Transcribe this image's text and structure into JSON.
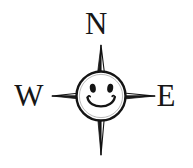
{
  "illustration": {
    "title": "Compass rose with smiley face",
    "width": 193,
    "height": 168,
    "background_color": "#ffffff",
    "ink_color": "#161616",
    "style": "hand-drawn black ink line art on white paper"
  },
  "labels": {
    "north": "N",
    "west": "W",
    "east": "E"
  },
  "compass": {
    "center_x": 101,
    "center_y": 96,
    "points": [
      {
        "name": "north-point",
        "direction": "N",
        "tip_x": 101,
        "tip_y": 45
      },
      {
        "name": "south-point",
        "direction": "S",
        "tip_x": 101,
        "tip_y": 155
      },
      {
        "name": "west-point",
        "direction": "W",
        "tip_x": 52,
        "tip_y": 96
      },
      {
        "name": "east-point",
        "direction": "E",
        "tip_x": 155,
        "tip_y": 96
      }
    ]
  },
  "face": {
    "name": "smiley-face",
    "center_x": 101,
    "center_y": 96,
    "radius": 25,
    "expression": "smiling",
    "eyes": [
      {
        "name": "left-eye",
        "cx": 93,
        "cy": 88
      },
      {
        "name": "right-eye",
        "cx": 110,
        "cy": 88
      }
    ],
    "mouth": {
      "name": "smile-arc",
      "cx": 101,
      "cy": 98
    }
  }
}
